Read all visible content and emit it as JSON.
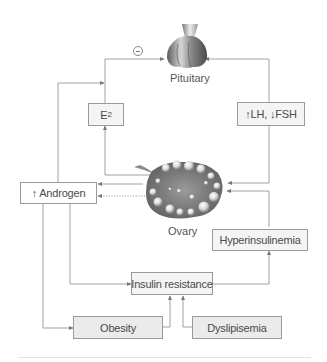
{
  "diagram": {
    "type": "flowchart",
    "organs": {
      "pituitary": {
        "label": "Pituitary"
      },
      "ovary": {
        "label": "Ovary"
      }
    },
    "feedback_symbol": "minus-circle",
    "boxes": {
      "e2": {
        "main": "E",
        "sub": "2"
      },
      "lh_fsh": {
        "label": "↑LH, ↓FSH"
      },
      "androgen": {
        "label": "↑ Androgen"
      },
      "hyperinsulinemia": {
        "label": "Hyperinsulinemia"
      },
      "insulin_resistance": {
        "label": "Insulin resistance"
      },
      "obesity": {
        "label": "Obesity"
      },
      "dyslipisemia": {
        "label": "Dyslipisemia"
      }
    },
    "edges": [
      {
        "from": "E2",
        "to": "Pituitary",
        "note": "negative feedback (⊖)"
      },
      {
        "from": "Ovary",
        "to": "E2"
      },
      {
        "from": "Pituitary",
        "to": "↑LH, ↓FSH"
      },
      {
        "from": "↑LH, ↓FSH",
        "to": "Ovary"
      },
      {
        "from": "Ovary",
        "to": "↑ Androgen",
        "style": "solid"
      },
      {
        "from": "Ovary",
        "to": "↑ Androgen",
        "style": "dotted"
      },
      {
        "from": "↑ Androgen",
        "to": "E2 pathway"
      },
      {
        "from": "↑ Androgen",
        "to": "Insulin resistance"
      },
      {
        "from": "↑ Androgen",
        "to": "Obesity"
      },
      {
        "from": "Obesity",
        "to": "Insulin resistance"
      },
      {
        "from": "Dyslipisemia",
        "to": "Insulin resistance"
      },
      {
        "from": "Insulin resistance",
        "to": "Hyperinsulinemia"
      },
      {
        "from": "Hyperinsulinemia",
        "to": "Ovary"
      }
    ],
    "colors": {
      "line": "#8c8c8c",
      "box_border": "#9a9a9a",
      "box_light_fill": "#f4f4f4",
      "box_dark_fill": "#ebebeb",
      "organ_gray": "#8a8a8a"
    }
  }
}
